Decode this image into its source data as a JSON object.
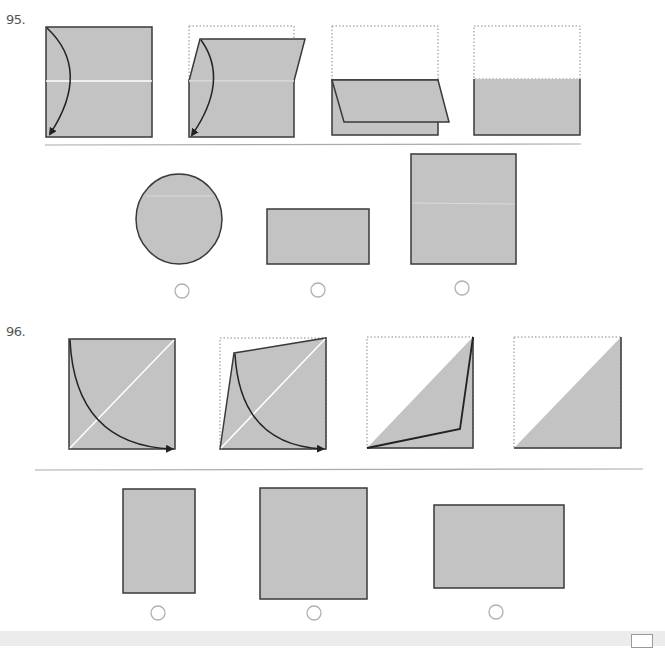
{
  "questions": [
    {
      "number": "95.",
      "steps": [
        "fold-top-half-down-step1",
        "fold-in-progress-step2",
        "folded-step3",
        "result-step4"
      ],
      "options": [
        {
          "shape": "circle",
          "selected": false
        },
        {
          "shape": "wide-rectangle",
          "selected": false
        },
        {
          "shape": "square",
          "selected": false
        }
      ]
    },
    {
      "number": "96.",
      "steps": [
        "fold-diagonal-step1",
        "fold-in-progress-step2",
        "folded-step3",
        "result-triangle-step4"
      ],
      "options": [
        {
          "shape": "tall-rectangle",
          "selected": false
        },
        {
          "shape": "square",
          "selected": false
        },
        {
          "shape": "wide-rectangle",
          "selected": false
        }
      ]
    }
  ],
  "colors": {
    "fill": "#c3c3c3",
    "stroke": "#3a3a3a",
    "crease": "#ffffff",
    "dotted": "#888888",
    "divider": "#aaaaaa",
    "radio": "#b0b0b0"
  }
}
